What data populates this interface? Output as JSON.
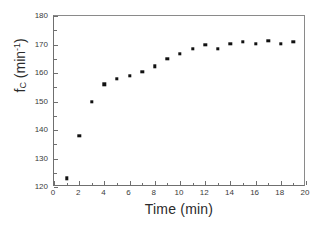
{
  "chart_data": {
    "type": "scatter",
    "title": "",
    "xlabel": "Time (min)",
    "ylabel_parts": {
      "symbol": "f",
      "subscript": "C",
      "unit_base": " (min",
      "unit_exp": "-1",
      "unit_close": ")"
    },
    "ylabel": "f_C (min^-1)",
    "xlim": [
      0,
      20
    ],
    "ylim": [
      120,
      180
    ],
    "xticks": [
      0,
      2,
      4,
      6,
      8,
      10,
      12,
      14,
      16,
      18,
      20
    ],
    "yticks": [
      120,
      130,
      140,
      150,
      160,
      170,
      180
    ],
    "xminor_ticks": [
      1,
      3,
      5,
      7,
      9,
      11,
      13,
      15,
      17,
      19
    ],
    "yminor_ticks": [
      125,
      135,
      145,
      155,
      165,
      175
    ],
    "grid": false,
    "legend": false,
    "marker_color": "#111111",
    "marker_shape": "square",
    "x": [
      1,
      2,
      3,
      4,
      5,
      6,
      7,
      8,
      9,
      10,
      11,
      12,
      13,
      14,
      15,
      16,
      17,
      18,
      19
    ],
    "values": [
      123,
      138,
      150,
      156,
      158,
      159,
      160.4,
      162.4,
      165,
      166.7,
      168.4,
      169.8,
      168.4,
      170.2,
      170.9,
      170.2,
      171.2,
      170.2,
      170.9
    ],
    "series": [
      {
        "name": "fC",
        "points": [
          {
            "x": 1,
            "y": 123
          },
          {
            "x": 2,
            "y": 138
          },
          {
            "x": 3,
            "y": 150
          },
          {
            "x": 4,
            "y": 156
          },
          {
            "x": 5,
            "y": 158
          },
          {
            "x": 6,
            "y": 159
          },
          {
            "x": 7,
            "y": 160.4
          },
          {
            "x": 8,
            "y": 162.4
          },
          {
            "x": 9,
            "y": 165
          },
          {
            "x": 10,
            "y": 166.7
          },
          {
            "x": 11,
            "y": 168.4
          },
          {
            "x": 12,
            "y": 169.8
          },
          {
            "x": 13,
            "y": 168.4
          },
          {
            "x": 14,
            "y": 170.2
          },
          {
            "x": 15,
            "y": 170.9
          },
          {
            "x": 16,
            "y": 170.2
          },
          {
            "x": 17,
            "y": 171.2
          },
          {
            "x": 18,
            "y": 170.2
          },
          {
            "x": 19,
            "y": 170.9
          }
        ]
      }
    ]
  }
}
